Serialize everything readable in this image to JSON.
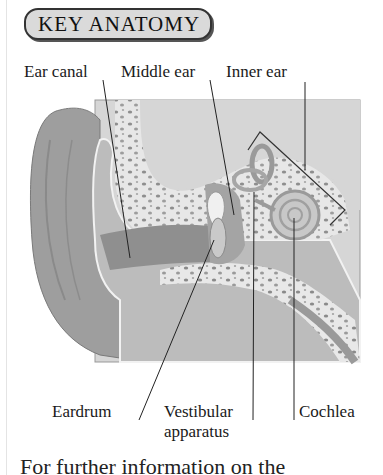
{
  "badge": {
    "title": "KEY ANATOMY"
  },
  "labels": {
    "ear_canal": "Ear canal",
    "middle_ear": "Middle ear",
    "inner_ear": "Inner ear",
    "eardrum": "Eardrum",
    "vestibular_1": "Vestibular",
    "vestibular_2": "apparatus",
    "cochlea": "Cochlea"
  },
  "footer": {
    "text": "For further information on the"
  },
  "colors": {
    "skin": "#9c9c9c",
    "tissue": "#bdbdbd",
    "bone": "#e6e6e6",
    "background_panel": "#d4d4d4",
    "line": "#222222"
  }
}
